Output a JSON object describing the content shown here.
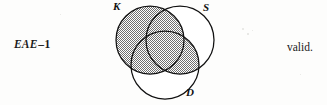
{
  "problem": {
    "form_label_italic": "EAE",
    "form_label_dash": "–",
    "form_label_number": "1",
    "verdict": "valid."
  },
  "diagram": {
    "type": "venn-3-set",
    "sets": [
      {
        "id": "K",
        "label": "K",
        "cx": 40,
        "cy": 40,
        "r": 34,
        "label_position": "top-left"
      },
      {
        "id": "S",
        "label": "S",
        "cx": 70,
        "cy": 40,
        "r": 34,
        "label_position": "top-right"
      },
      {
        "id": "D",
        "label": "D",
        "cx": 55,
        "cy": 65,
        "r": 34,
        "label_position": "bottom-right"
      }
    ],
    "shaded_regions": [
      "K only",
      "K and S only",
      "K and D only",
      "K and S and D",
      "S and D only"
    ],
    "shading_description": "K circle entirely shaded plus the S-intersect-D region",
    "stroke_color": "#111111",
    "shade_color": "#8d8d8d",
    "fill_color": "#ffffff"
  }
}
